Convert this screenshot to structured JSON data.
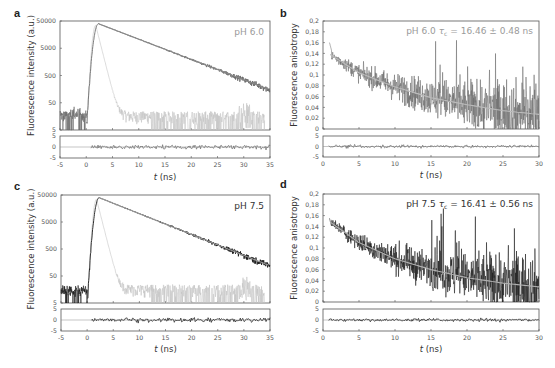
{
  "figure": {
    "panels": [
      "a",
      "b",
      "c",
      "d"
    ]
  },
  "colors": {
    "frame": "#555555",
    "raw_ph6": "#6a6a6a",
    "fit_ph6": "#8a8a8a",
    "irf": "#c4c4c4",
    "raw_ph75": "#1a1a1a",
    "fit_ph75": "#9a9a9a",
    "annot_ph6": "#9a9a9a",
    "annot_ph75": "#333333"
  },
  "chart_data": [
    {
      "panel": "a",
      "type": "line",
      "title": "",
      "annotation": "pH 6.0",
      "xlabel": "t (ns)",
      "ylabel": "Fluorescence intensity (a.u.)",
      "yscale": "log",
      "xlim": [
        -5,
        35
      ],
      "ylim": [
        5,
        50000
      ],
      "xticks": [
        "-5",
        "0",
        "5",
        "10",
        "15",
        "20",
        "25",
        "30",
        "35"
      ],
      "yticks": [
        "5",
        "50",
        "500",
        "5000",
        "50000"
      ],
      "residuals": {
        "ylim": [
          -5,
          5
        ],
        "yticks": [
          "5",
          "0",
          "-5"
        ]
      },
      "series": [
        {
          "name": "fluorescence decay (data + fit)",
          "peak_t": 2.3,
          "peak": 40000,
          "tau_ns": 4.8,
          "end_value_t35": 150,
          "baseline": 18
        },
        {
          "name": "IRF",
          "peak_t": 1.8,
          "peak": 35000,
          "fall_to_t": 6,
          "baseline": 10
        }
      ]
    },
    {
      "panel": "b",
      "type": "line",
      "annotation": "pH 6.0   τc = 16.46 ± 0.48 ns",
      "annotation_ph": "pH 6.0",
      "annotation_tau": "τ",
      "annotation_tau_sub": "c",
      "annotation_value": " = 16.46 ± 0.48 ns",
      "xlabel": "t (ns)",
      "ylabel": "Fluorescence anisotropy",
      "xlim": [
        0,
        30
      ],
      "ylim": [
        0,
        0.2
      ],
      "xticks": [
        "0",
        "5",
        "10",
        "15",
        "20",
        "25",
        "30"
      ],
      "yticks": [
        "0",
        "0,02",
        "0,04",
        "0,06",
        "0,08",
        "0,1",
        "0,12",
        "0,14",
        "0,16",
        "0,18",
        "0,2"
      ],
      "residuals": {
        "ylim": [
          -5,
          5
        ],
        "yticks": [
          "5",
          "0",
          "-5"
        ]
      },
      "series": [
        {
          "name": "anisotropy fit",
          "x": [
            1,
            5,
            10,
            15,
            20,
            25,
            30
          ],
          "values": [
            0.138,
            0.104,
            0.078,
            0.058,
            0.045,
            0.034,
            0.027
          ]
        },
        {
          "name": "anisotropy data",
          "start": 0.16,
          "noise_growth": "increasing with t"
        }
      ]
    },
    {
      "panel": "c",
      "type": "line",
      "annotation": "pH 7.5",
      "xlabel": "t (ns)",
      "ylabel": "Fluorescence intensity (a.u.)",
      "yscale": "log",
      "xlim": [
        -5,
        35
      ],
      "ylim": [
        5,
        50000
      ],
      "xticks": [
        "-5",
        "0",
        "5",
        "10",
        "15",
        "20",
        "25",
        "30",
        "35"
      ],
      "yticks": [
        "5",
        "50",
        "500",
        "5000",
        "50000"
      ],
      "residuals": {
        "ylim": [
          -5,
          5
        ],
        "yticks": [
          "5",
          "0",
          "-5"
        ]
      },
      "series": [
        {
          "name": "fluorescence decay (data + fit)",
          "peak_t": 2.3,
          "peak": 40000,
          "tau_ns": 4.9,
          "end_value_t35": 120,
          "baseline": 15
        },
        {
          "name": "IRF",
          "peak_t": 1.8,
          "peak": 35000,
          "fall_to_t": 6,
          "baseline": 10
        }
      ]
    },
    {
      "panel": "d",
      "type": "line",
      "annotation": "pH 7.5   τc = 16.41 ± 0.56 ns",
      "annotation_ph": "pH 7.5",
      "annotation_tau": "τ",
      "annotation_tau_sub": "c",
      "annotation_value": " = 16.41 ± 0.56 ns",
      "xlabel": "t (ns)",
      "ylabel": "Fluorescence anisotropy",
      "xlim": [
        0,
        30
      ],
      "ylim": [
        0,
        0.2
      ],
      "xticks": [
        "0",
        "5",
        "10",
        "15",
        "20",
        "25",
        "30"
      ],
      "yticks": [
        "0",
        "0,02",
        "0,04",
        "0,06",
        "0,08",
        "0,1",
        "0,12",
        "0,14",
        "0,16",
        "0,18",
        "0,2"
      ],
      "residuals": {
        "ylim": [
          -5,
          5
        ],
        "yticks": [
          "5",
          "0",
          "-5"
        ]
      },
      "series": [
        {
          "name": "anisotropy fit",
          "x": [
            1,
            5,
            10,
            15,
            20,
            25,
            30
          ],
          "values": [
            0.148,
            0.11,
            0.08,
            0.06,
            0.045,
            0.035,
            0.028
          ]
        },
        {
          "name": "anisotropy data",
          "start": 0.155,
          "noise_growth": "increasing with t"
        }
      ]
    }
  ]
}
